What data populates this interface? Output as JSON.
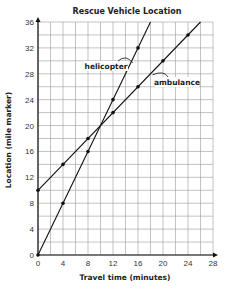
{
  "chart_data": {
    "type": "line",
    "title": "Rescue Vehicle Location",
    "xlabel": "Travel time (minutes)",
    "ylabel": "Location (mile marker)",
    "xlim": [
      0,
      28
    ],
    "ylim": [
      0,
      36
    ],
    "x_ticks": [
      0,
      4,
      8,
      12,
      16,
      20,
      24,
      28
    ],
    "y_ticks": [
      0,
      4,
      8,
      12,
      16,
      20,
      24,
      28,
      32,
      36
    ],
    "grid": true,
    "grid_step_x": 2,
    "grid_step_y": 2,
    "legend": "inline labels with arrows",
    "series": [
      {
        "name": "helicopter",
        "points": [
          [
            0,
            0
          ],
          [
            4,
            8
          ],
          [
            8,
            16
          ],
          [
            12,
            24
          ],
          [
            16,
            32
          ]
        ],
        "line_extends_to": [
          18,
          36
        ]
      },
      {
        "name": "ambulance",
        "points": [
          [
            0,
            10
          ],
          [
            4,
            14
          ],
          [
            8,
            18
          ],
          [
            12,
            22
          ],
          [
            16,
            26
          ],
          [
            20,
            30
          ],
          [
            24,
            34
          ]
        ],
        "line_extends_to": [
          26,
          36
        ]
      }
    ]
  },
  "labels": {
    "title": "Rescue Vehicle Location",
    "xlabel": "Travel time (minutes)",
    "ylabel": "Location (mile marker)",
    "helicopter": "helicopter",
    "ambulance": "ambulance"
  }
}
